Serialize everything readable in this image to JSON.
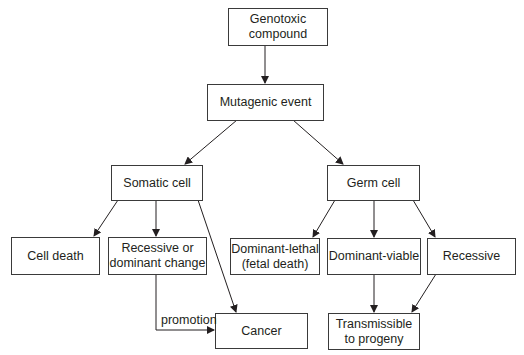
{
  "diagram": {
    "nodes": {
      "genotoxic": "Genotoxic compound",
      "mutagenic": "Mutagenic event",
      "somatic": "Somatic cell",
      "germ": "Germ cell",
      "cell_death": "Cell death",
      "recessive_dominant_1": "Recessive or",
      "recessive_dominant_2": "dominant change",
      "dominant_lethal_1": "Dominant-lethal",
      "dominant_lethal_2": "(fetal death)",
      "dominant_viable": "Dominant-viable",
      "recessive": "Recessive",
      "cancer": "Cancer",
      "transmissible_1": "Transmissible",
      "transmissible_2": "to progeny"
    },
    "edge_labels": {
      "promotion": "promotion"
    },
    "edges": [
      [
        "Genotoxic compound",
        "Mutagenic event"
      ],
      [
        "Mutagenic event",
        "Somatic cell"
      ],
      [
        "Mutagenic event",
        "Germ cell"
      ],
      [
        "Somatic cell",
        "Cell death"
      ],
      [
        "Somatic cell",
        "Recessive or dominant change"
      ],
      [
        "Somatic cell",
        "Cancer"
      ],
      [
        "Recessive or dominant change",
        "Cancer",
        "promotion"
      ],
      [
        "Germ cell",
        "Dominant-lethal (fetal death)"
      ],
      [
        "Germ cell",
        "Dominant-viable"
      ],
      [
        "Germ cell",
        "Recessive"
      ],
      [
        "Dominant-viable",
        "Transmissible to progeny"
      ],
      [
        "Recessive",
        "Transmissible to progeny"
      ]
    ]
  }
}
